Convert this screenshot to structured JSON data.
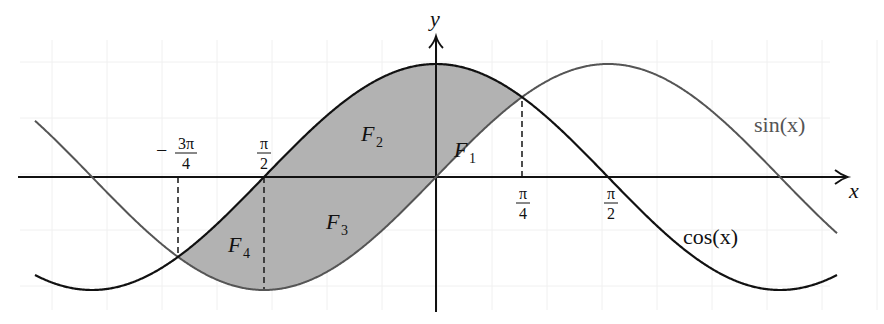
{
  "figure": {
    "width": 884,
    "height": 324,
    "colors": {
      "background": "#ffffff",
      "fill": "#b2b2b2",
      "cos_curve": "#111111",
      "sin_curve": "#555555",
      "axis": "#111111",
      "grid": "#f0f0f0",
      "dash": "#222222"
    }
  },
  "axes": {
    "x_label": "x",
    "y_label": "y"
  },
  "curve_labels": {
    "sin": "sin(x)",
    "cos": "cos(x)"
  },
  "region_labels": [
    {
      "name": "F",
      "sub": "1"
    },
    {
      "name": "F",
      "sub": "2"
    },
    {
      "name": "F",
      "sub": "3"
    },
    {
      "name": "F",
      "sub": "4"
    }
  ],
  "ticks": [
    {
      "sign": "−",
      "num": "3π",
      "den": "4"
    },
    {
      "sign": "",
      "num": "π",
      "den": "2"
    },
    {
      "sign": "",
      "num": "π",
      "den": "4"
    },
    {
      "sign": "",
      "num": "π",
      "den": "2"
    }
  ],
  "chart_data": {
    "type": "line",
    "title": "",
    "xlabel": "x",
    "ylabel": "y",
    "grid": true,
    "series": [
      {
        "name": "cos(x)",
        "function": "cos(x)",
        "color": "#111111"
      },
      {
        "name": "sin(x)",
        "function": "sin(x)",
        "color": "#555555"
      }
    ],
    "x_range_approx": [
      -2.34,
      2.32
    ],
    "y_range": [
      -1,
      1
    ],
    "x_tick_labels_shown": [
      "−3π/4",
      "π/2",
      "π/4",
      "π/2"
    ],
    "shaded_regions": [
      "F1",
      "F2",
      "F3",
      "F4"
    ],
    "intersections": [
      "−3π/4",
      "π/4"
    ],
    "dashed_verticals": [
      "−3π/4",
      "π/2 (left, at trough of sin)",
      "π/4"
    ],
    "pixel_mapping": {
      "origin_x": 436,
      "origin_y": 177,
      "px_per_half_pi": 172,
      "px_per_unit_y": 113,
      "x_start": 35,
      "x_end": 837
    }
  }
}
